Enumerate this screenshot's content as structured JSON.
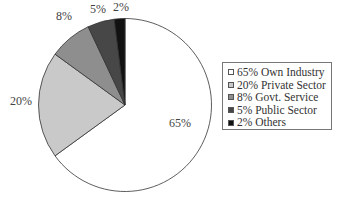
{
  "chart_data": {
    "type": "pie",
    "title": "",
    "categories": [
      "Own Industry",
      "Private Sector",
      "Govt. Service",
      "Public Sector",
      "Others"
    ],
    "values": [
      65,
      20,
      8,
      5,
      2
    ],
    "unit": "%",
    "slice_labels": [
      "65%",
      "20%",
      "8%",
      "5%",
      "2%"
    ],
    "colors": [
      "#ffffff",
      "#c9c9c9",
      "#8e8e8e",
      "#474747",
      "#111111"
    ],
    "legend": {
      "position": "right",
      "entries": [
        "65% Own Industry",
        "20% Private Sector",
        "8% Govt. Service",
        "5% Public Sector",
        "2% Others"
      ]
    },
    "start_angle_deg": 0,
    "direction": "clockwise"
  }
}
